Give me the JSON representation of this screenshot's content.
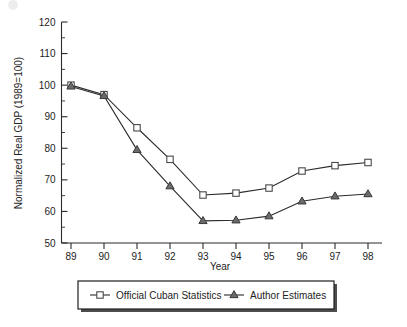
{
  "chart_data": {
    "type": "line",
    "title": "",
    "subtitle": "",
    "xlabel": "Year",
    "ylabel": "Normalized Real GDP (1989=100)",
    "categories": [
      "89",
      "90",
      "91",
      "92",
      "93",
      "94",
      "95",
      "96",
      "97",
      "98"
    ],
    "x": [
      89,
      90,
      91,
      92,
      93,
      94,
      95,
      96,
      97,
      98
    ],
    "xlim": [
      88.6,
      98.4
    ],
    "ylim": [
      50,
      120
    ],
    "ytick_labels": [
      "120",
      "110",
      "100",
      "90",
      "80",
      "70",
      "60",
      "50"
    ],
    "ytick_values": [
      120,
      110,
      100,
      90,
      80,
      70,
      60,
      50
    ],
    "ytick_minor_step": 5,
    "xtick_labels": [
      "89",
      "90",
      "91",
      "92",
      "93",
      "94",
      "95",
      "96",
      "97",
      "98"
    ],
    "grid": false,
    "legend_position": "below-plot",
    "series": [
      {
        "name": "Official Cuban Statistics",
        "marker": "open-square",
        "color": "#2b2b2b",
        "values": [
          100,
          97,
          86.5,
          76.5,
          65.2,
          65.8,
          67.4,
          72.8,
          74.5,
          75.5
        ]
      },
      {
        "name": "Author Estimates",
        "marker": "filled-triangle",
        "color": "#6b6b6b",
        "values": [
          99.6,
          96.6,
          79.5,
          68,
          57,
          57.2,
          58.5,
          63.2,
          64.8,
          65.5
        ]
      }
    ]
  },
  "legend": {
    "entries": [
      {
        "label": "Official Cuban Statistics",
        "marker": "open-square"
      },
      {
        "label": "Author Estimates",
        "marker": "filled-triangle"
      }
    ]
  }
}
